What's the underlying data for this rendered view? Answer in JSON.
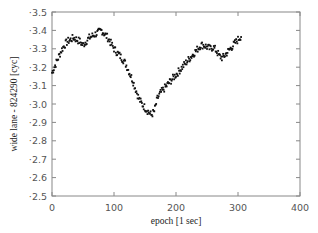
{
  "chart_data": {
    "type": "scatter",
    "title": "",
    "xlabel": "epoch  [1 sec]",
    "ylabel": "wide lane - 824290  [cyc]",
    "xlim": [
      0,
      400
    ],
    "ylim": [
      2.5,
      3.5
    ],
    "xticks": [
      0,
      100,
      200,
      300,
      400
    ],
    "yticks": [
      2.5,
      2.6,
      2.7,
      2.8,
      2.9,
      3.0,
      3.1,
      3.2,
      3.3,
      3.4,
      3.5
    ],
    "xtick_labels": [
      "0",
      "100",
      "200",
      "300",
      "400"
    ],
    "ytick_labels": [
      "2.5",
      "2.6",
      "2.7",
      "2.8",
      "2.9",
      "3.0",
      "3.1",
      "3.2",
      "3.3",
      "3.4",
      "3.5"
    ],
    "grid": false,
    "legend": null,
    "marker": "small square",
    "marker_color": "#111111",
    "series": [
      {
        "name": "wide lane",
        "trend_points": [
          {
            "x": 0,
            "y": 3.17
          },
          {
            "x": 5,
            "y": 3.21
          },
          {
            "x": 10,
            "y": 3.25
          },
          {
            "x": 15,
            "y": 3.29
          },
          {
            "x": 20,
            "y": 3.32
          },
          {
            "x": 25,
            "y": 3.34
          },
          {
            "x": 30,
            "y": 3.35
          },
          {
            "x": 35,
            "y": 3.36
          },
          {
            "x": 40,
            "y": 3.35
          },
          {
            "x": 45,
            "y": 3.34
          },
          {
            "x": 50,
            "y": 3.32
          },
          {
            "x": 55,
            "y": 3.34
          },
          {
            "x": 60,
            "y": 3.36
          },
          {
            "x": 65,
            "y": 3.37
          },
          {
            "x": 70,
            "y": 3.38
          },
          {
            "x": 75,
            "y": 3.39
          },
          {
            "x": 80,
            "y": 3.4
          },
          {
            "x": 85,
            "y": 3.38
          },
          {
            "x": 90,
            "y": 3.36
          },
          {
            "x": 95,
            "y": 3.33
          },
          {
            "x": 100,
            "y": 3.3
          },
          {
            "x": 105,
            "y": 3.28
          },
          {
            "x": 110,
            "y": 3.26
          },
          {
            "x": 115,
            "y": 3.24
          },
          {
            "x": 120,
            "y": 3.21
          },
          {
            "x": 125,
            "y": 3.17
          },
          {
            "x": 130,
            "y": 3.13
          },
          {
            "x": 135,
            "y": 3.08
          },
          {
            "x": 140,
            "y": 3.03
          },
          {
            "x": 145,
            "y": 3.0
          },
          {
            "x": 150,
            "y": 2.98
          },
          {
            "x": 155,
            "y": 2.96
          },
          {
            "x": 160,
            "y": 2.94
          },
          {
            "x": 165,
            "y": 2.96
          },
          {
            "x": 170,
            "y": 3.03
          },
          {
            "x": 175,
            "y": 3.06
          },
          {
            "x": 180,
            "y": 3.08
          },
          {
            "x": 185,
            "y": 3.1
          },
          {
            "x": 190,
            "y": 3.12
          },
          {
            "x": 195,
            "y": 3.14
          },
          {
            "x": 200,
            "y": 3.16
          },
          {
            "x": 205,
            "y": 3.18
          },
          {
            "x": 210,
            "y": 3.2
          },
          {
            "x": 215,
            "y": 3.22
          },
          {
            "x": 220,
            "y": 3.24
          },
          {
            "x": 225,
            "y": 3.26
          },
          {
            "x": 230,
            "y": 3.28
          },
          {
            "x": 235,
            "y": 3.3
          },
          {
            "x": 240,
            "y": 3.32
          },
          {
            "x": 245,
            "y": 3.32
          },
          {
            "x": 250,
            "y": 3.31
          },
          {
            "x": 255,
            "y": 3.3
          },
          {
            "x": 260,
            "y": 3.31
          },
          {
            "x": 265,
            "y": 3.29
          },
          {
            "x": 270,
            "y": 3.26
          },
          {
            "x": 275,
            "y": 3.25
          },
          {
            "x": 280,
            "y": 3.27
          },
          {
            "x": 285,
            "y": 3.29
          },
          {
            "x": 290,
            "y": 3.31
          },
          {
            "x": 295,
            "y": 3.33
          },
          {
            "x": 300,
            "y": 3.35
          },
          {
            "x": 305,
            "y": 3.37
          }
        ],
        "x_range": [
          0,
          305
        ],
        "noise_amplitude": 0.02,
        "points_per_unit_x": 1
      }
    ],
    "annotations": []
  },
  "layout": {
    "plot_left": 52,
    "plot_right": 300,
    "plot_top": 12,
    "plot_bottom": 196,
    "axis_color": "#888888"
  }
}
